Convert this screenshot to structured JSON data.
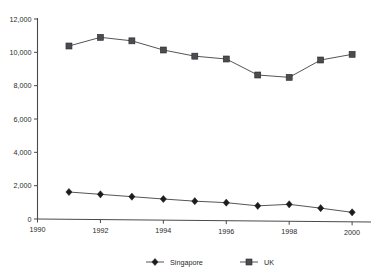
{
  "chart_data": {
    "type": "line",
    "title": "",
    "subtitle": "",
    "xlabel": "",
    "ylabel": "",
    "x": [
      1991,
      1992,
      1993,
      1994,
      1995,
      1996,
      1997,
      1998,
      1999,
      2000
    ],
    "xlim": [
      1990,
      2000.6
    ],
    "ylim": [
      0,
      12000
    ],
    "grid": false,
    "legend_position": "bottom",
    "xticks": [
      1990,
      1992,
      1994,
      1996,
      1998,
      2000
    ],
    "xtick_labels": [
      "1990",
      "1992",
      "1994",
      "1996",
      "1998",
      "2000"
    ],
    "yticks": [
      0,
      2000,
      4000,
      6000,
      8000,
      10000,
      12000
    ],
    "ytick_labels": [
      "0",
      "2,000",
      "4,000",
      "6,000",
      "8,000",
      "10,000",
      "12,000"
    ],
    "series": [
      {
        "name": "Singapore",
        "marker": "diamond",
        "color": "#1c1c1c",
        "values": [
          1620,
          1480,
          1340,
          1200,
          1070,
          980,
          790,
          880,
          650,
          400
        ]
      },
      {
        "name": "UK",
        "marker": "square",
        "color": "#4b4b52",
        "values": [
          10380,
          10900,
          10690,
          10140,
          9770,
          9600,
          8640,
          8500,
          9540,
          9880
        ]
      }
    ]
  },
  "legend": {
    "items": [
      {
        "label": "Singapore",
        "marker": "diamond"
      },
      {
        "label": "UK",
        "marker": "square"
      }
    ]
  }
}
